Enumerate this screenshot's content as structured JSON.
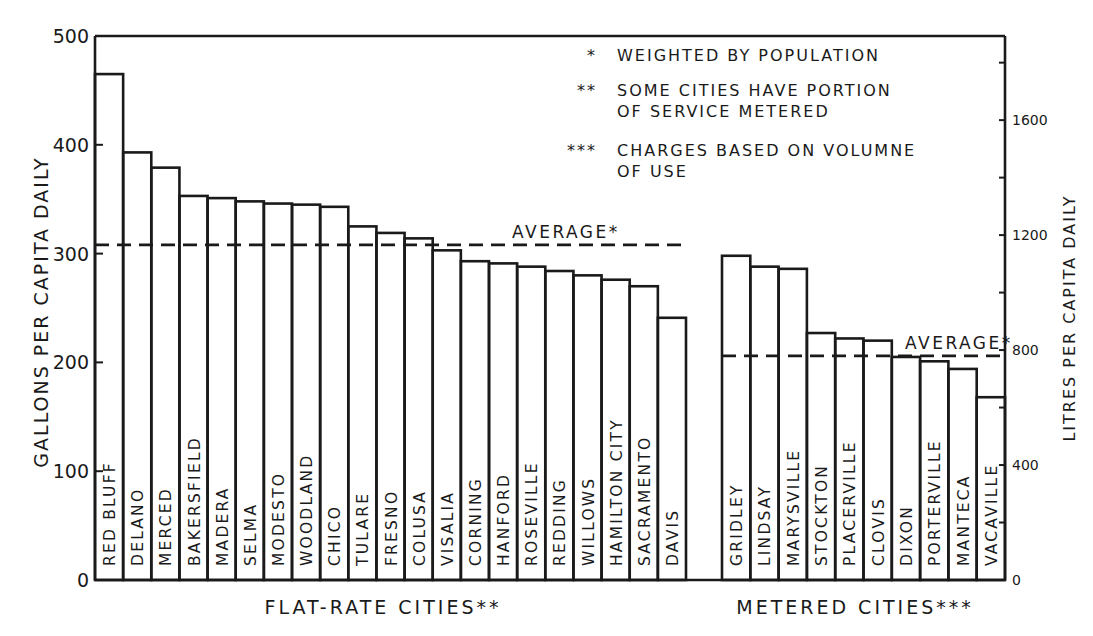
{
  "chart_data": {
    "type": "bar",
    "title": "",
    "ylabel": "GALLONS PER CAPITA DAILY",
    "ylabel_right": "LITRES PER CAPITA DAILY",
    "ylim": [
      0,
      500
    ],
    "yticks": [
      0,
      100,
      200,
      300,
      400,
      500
    ],
    "ylim_right": [
      0,
      1892.7
    ],
    "yticks_right_labeled": [
      0,
      400,
      800,
      1200,
      1600
    ],
    "yticks_right_minor": [
      200,
      600,
      1000,
      1400,
      1800
    ],
    "grid": false,
    "groups": [
      {
        "name": "FLAT-RATE CITIES**",
        "categories": [
          "RED BLUFF",
          "DELANO",
          "MERCED",
          "BAKERSFIELD",
          "MADERA",
          "SELMA",
          "MODESTO",
          "WOODLAND",
          "CHICO",
          "TULARE",
          "FRESNO",
          "COLUSA",
          "VISALIA",
          "CORNING",
          "HANFORD",
          "ROSEVILLE",
          "REDDING",
          "WILLOWS",
          "HAMILTON CITY",
          "SACRAMENTO",
          "DAVIS"
        ],
        "values": [
          465,
          393,
          379,
          353,
          351,
          348,
          346,
          345,
          343,
          325,
          319,
          314,
          303,
          293,
          291,
          288,
          284,
          280,
          276,
          270,
          241
        ],
        "average": 308,
        "average_label": "AVERAGE*"
      },
      {
        "name": "METERED CITIES***",
        "categories": [
          "GRIDLEY",
          "LINDSAY",
          "MARYSVILLE",
          "STOCKTON",
          "PLACERVILLE",
          "CLOVIS",
          "DIXON",
          "PORTERVILLE",
          "MANTECA",
          "VACAVILLE"
        ],
        "values": [
          298,
          288,
          286,
          227,
          222,
          220,
          205,
          201,
          194,
          168
        ],
        "average": 206,
        "average_label": "AVERAGE*"
      }
    ],
    "legend": {
      "placement": "top-right",
      "entries": [
        {
          "marker": "*",
          "lines": [
            "WEIGHTED BY POPULATION"
          ]
        },
        {
          "marker": "**",
          "lines": [
            "SOME CITIES HAVE PORTION",
            "OF SERVICE METERED"
          ]
        },
        {
          "marker": "***",
          "lines": [
            "CHARGES BASED ON VOLUMNE",
            "OF USE"
          ]
        }
      ]
    }
  }
}
